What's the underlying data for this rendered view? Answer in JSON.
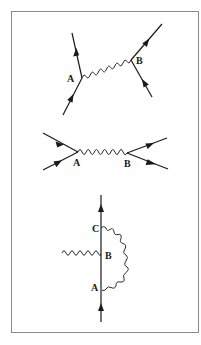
{
  "figure": {
    "colors": {
      "line": "#1a1a1a",
      "border": "#8a8a8a",
      "background": "#ffffff"
    },
    "diagrams": [
      {
        "id": "diagram-1",
        "vertices": [
          {
            "label": "A"
          },
          {
            "label": "B"
          }
        ],
        "propagator": "wavy photon line A to B"
      },
      {
        "id": "diagram-2",
        "vertices": [
          {
            "label": "A"
          },
          {
            "label": "B"
          }
        ],
        "propagator": "wavy photon line A to B"
      },
      {
        "id": "diagram-3",
        "vertices": [
          {
            "label": "C"
          },
          {
            "label": "B"
          },
          {
            "label": "A"
          }
        ],
        "propagator": "external wavy line into B, wavy loop from C to A"
      }
    ]
  }
}
